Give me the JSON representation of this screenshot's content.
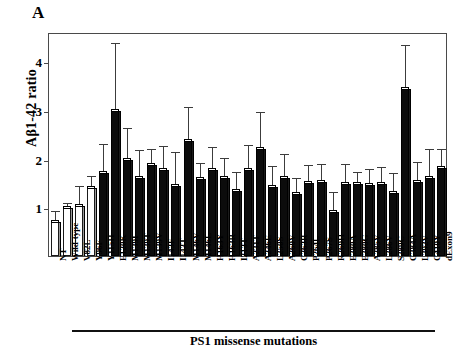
{
  "figure": {
    "panel_label": "A",
    "ylabel": "Aβ1-42 ratio",
    "group_caption": "PS1 missense mutations"
  },
  "chart_data": {
    "type": "bar",
    "title": "",
    "xlabel": "PS1 missense mutations",
    "ylabel": "Aβ1-42 ratio",
    "ylim": [
      0,
      4.6
    ],
    "yticks": [
      1,
      2,
      3,
      4
    ],
    "ytick_labels": [
      "1",
      "2",
      "3",
      "4"
    ],
    "grid": false,
    "legend": null,
    "error_bars": "std",
    "categories": [
      "NT",
      "Wild-type",
      "V82L",
      "Y96F",
      "Y115H",
      "E120K",
      "M139I",
      "M139T",
      "M139V",
      "I143F",
      "I143T",
      "M146V",
      "M146L",
      "H163Y",
      "H163R",
      "I213T",
      "A231T",
      "A246E",
      "L250S",
      "A260V",
      "C263R",
      "P264L",
      "P267S",
      "R269H",
      "E280A",
      "E280G",
      "A285V",
      "L286V",
      "S289C",
      "G384A",
      "L392V",
      "C410Y",
      "dExon9"
    ],
    "values": [
      0.72,
      1.0,
      1.05,
      1.42,
      1.73,
      3.0,
      2.0,
      1.62,
      1.88,
      1.78,
      1.45,
      2.38,
      1.6,
      1.78,
      1.63,
      1.35,
      1.78,
      2.22,
      1.43,
      1.62,
      1.3,
      1.52,
      1.55,
      0.92,
      1.5,
      1.5,
      1.48,
      1.5,
      1.32,
      3.45,
      1.55,
      1.62,
      1.82
    ],
    "errors_upper": [
      0.2,
      0.08,
      0.38,
      0.22,
      0.58,
      1.38,
      0.62,
      0.55,
      0.32,
      0.47,
      0.68,
      0.68,
      0.32,
      0.45,
      0.38,
      0.38,
      0.5,
      0.73,
      0.42,
      0.48,
      0.3,
      0.35,
      0.33,
      0.4,
      0.38,
      0.23,
      0.3,
      0.32,
      0.38,
      0.88,
      0.38,
      0.58,
      0.38
    ],
    "bar_styles": [
      "open",
      "open",
      "open",
      "open",
      "dark",
      "dark",
      "dark",
      "dark",
      "dark",
      "dark",
      "dark",
      "dark",
      "dark",
      "dark",
      "dark",
      "dark",
      "dark",
      "dark",
      "dark",
      "dark",
      "dark",
      "dark",
      "dark",
      "dark",
      "dark",
      "dark",
      "dark",
      "dark",
      "dark",
      "dark",
      "dark",
      "dark",
      "dark"
    ],
    "group_span": {
      "label": "PS1 missense mutations",
      "from": "V82L",
      "to": "C410Y"
    }
  }
}
